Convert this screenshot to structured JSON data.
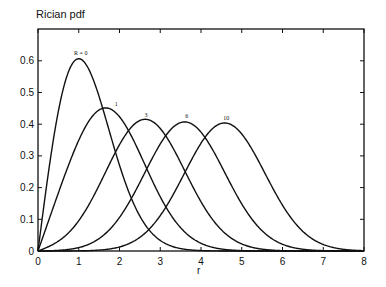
{
  "chart_data": {
    "type": "line",
    "title": "Rician pdf",
    "xlabel": "r",
    "ylabel": "",
    "xlim": [
      0,
      8
    ],
    "ylim": [
      0,
      0.7
    ],
    "xticks": [
      0,
      1,
      2,
      3,
      4,
      5,
      6,
      7,
      8
    ],
    "yticks": [
      0,
      0.1,
      0.2,
      0.3,
      0.4,
      0.5,
      0.6
    ],
    "ytick_labels": [
      "0",
      "0.1",
      "0.2",
      "0.3",
      "0.4",
      "0.5",
      "0.6"
    ],
    "grid": false,
    "legend": "none (inline curve labels at peaks)",
    "x": [
      0,
      0.5,
      1,
      1.5,
      2,
      2.5,
      3,
      3.5,
      4,
      4.5,
      5,
      5.5,
      6,
      6.5,
      7,
      7.5,
      8
    ],
    "series": [
      {
        "name": "R = 0",
        "label": "R = 0",
        "K": 0,
        "peak": [
          1.0,
          0.607
        ],
        "values": [
          0,
          0.441,
          0.607,
          0.487,
          0.271,
          0.11,
          0.033,
          0.008,
          0.001,
          0,
          0,
          0,
          0,
          0,
          0,
          0,
          0
        ]
      },
      {
        "name": "1",
        "label": "1",
        "K": 1,
        "peak": [
          1.65,
          0.45
        ],
        "values": [
          0,
          0.22,
          0.4,
          0.45,
          0.38,
          0.24,
          0.12,
          0.05,
          0.015,
          0.004,
          0.001,
          0,
          0,
          0,
          0,
          0,
          0
        ]
      },
      {
        "name": "3",
        "label": "3",
        "K": 3,
        "peak": [
          2.6,
          0.41
        ],
        "values": [
          0,
          0.03,
          0.11,
          0.24,
          0.36,
          0.41,
          0.36,
          0.24,
          0.12,
          0.05,
          0.015,
          0.004,
          0.001,
          0,
          0,
          0,
          0
        ]
      },
      {
        "name": "6",
        "label": "6",
        "K": 6,
        "peak": [
          3.6,
          0.406
        ],
        "values": [
          0,
          0.002,
          0.02,
          0.06,
          0.14,
          0.26,
          0.37,
          0.41,
          0.35,
          0.23,
          0.12,
          0.05,
          0.015,
          0.004,
          0.001,
          0,
          0
        ]
      },
      {
        "name": "10",
        "label": "10",
        "K": 10,
        "peak": [
          4.57,
          0.4
        ],
        "values": [
          0,
          0,
          0.001,
          0.008,
          0.03,
          0.08,
          0.18,
          0.3,
          0.39,
          0.4,
          0.34,
          0.22,
          0.11,
          0.045,
          0.014,
          0.003,
          0.001
        ]
      }
    ]
  },
  "colors": {
    "line": "#111111",
    "axis": "#111111",
    "background": "#ffffff"
  }
}
